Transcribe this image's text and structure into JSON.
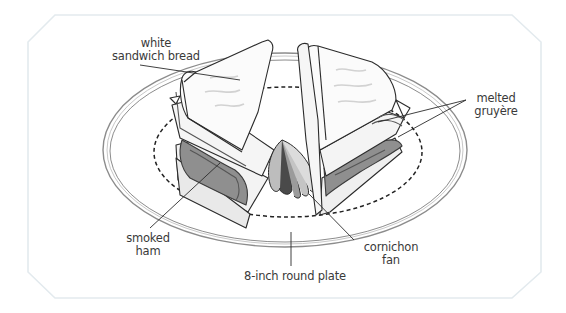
{
  "figure": {
    "frame_color": "#e6edf0",
    "ink_color": "#2b2b2b",
    "shade_color": "#9a9a9a"
  },
  "labels": {
    "bread": {
      "line1": "white",
      "line2": "sandwich bread"
    },
    "gruyere": {
      "line1": "melted",
      "line2": "gruyère"
    },
    "ham": {
      "line1": "smoked",
      "line2": "ham"
    },
    "cornichon": {
      "line1": "cornichon",
      "line2": "fan"
    },
    "plate": {
      "line1": "8-inch round plate"
    }
  }
}
